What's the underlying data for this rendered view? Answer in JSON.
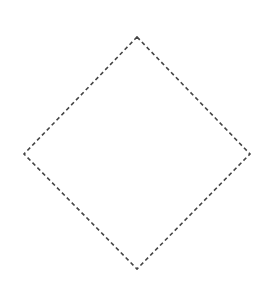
{
  "diagram": {
    "shapes": [
      {
        "type": "diamond",
        "stroke": "#444444",
        "fill": "none",
        "stroke_style": "dashed",
        "points": {
          "top": [
            137,
            37
          ],
          "right": [
            250,
            154
          ],
          "bottom": [
            137,
            269
          ],
          "left": [
            24,
            154
          ]
        }
      }
    ],
    "background": "#ffffff"
  }
}
